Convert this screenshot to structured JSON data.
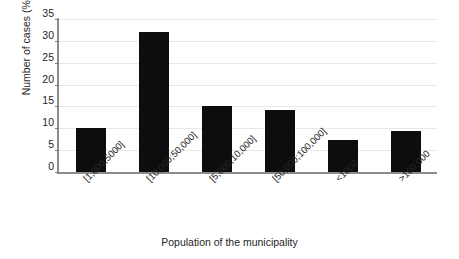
{
  "chart_data": {
    "type": "bar",
    "title": "",
    "subtitle": "",
    "xlabel": "Population of the municipality",
    "ylabel": "Number of cases (%)",
    "categories": [
      "[1,000;5000]",
      "[10,000;50,000]",
      "[5,000;10,000]",
      "[50,000;100,000]",
      "<1000",
      ">100,000"
    ],
    "values": [
      10.0,
      32.0,
      15.2,
      14.2,
      7.3,
      9.4
    ],
    "ylim": [
      0,
      35
    ],
    "yticks": [
      0,
      5,
      10,
      15,
      20,
      25,
      30,
      35
    ],
    "ytick_labels": [
      "0",
      "5",
      "10",
      "15",
      "20",
      "25",
      "30",
      "35"
    ],
    "grid": true,
    "grid_axis": "y",
    "legend": false,
    "legend_position": "none",
    "bar_color": "#0d0d0d",
    "gridline_color": "#e8e8e8",
    "axis_color": "#8c8c8c",
    "background_color": "#ffffff",
    "xtick_label_rotation": -45
  }
}
